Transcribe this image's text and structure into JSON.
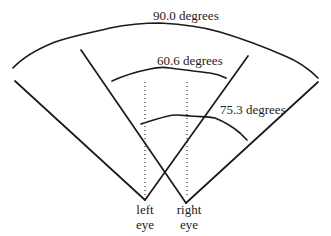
{
  "diagram": {
    "labels": {
      "outer_field": "90.0 degrees",
      "left_eye_field": "60.6 degrees",
      "right_eye_field": "75.3 degrees",
      "left_eye": [
        "left",
        "eye"
      ],
      "right_eye": [
        "right",
        "eye"
      ]
    },
    "colors": {
      "line": "#1a1a1a",
      "text": "#222222",
      "background": "#ffffff"
    }
  }
}
